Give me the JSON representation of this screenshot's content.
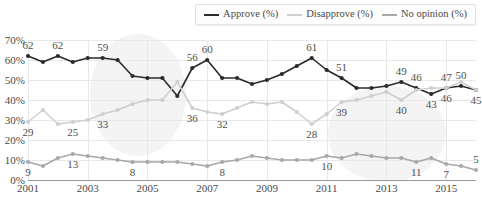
{
  "legend": {
    "items": [
      {
        "label": "Approve (%)",
        "color": "#2b2b2b"
      },
      {
        "label": "Disapprove (%)",
        "color": "#cfcfcf"
      },
      {
        "label": "No opinion (%)",
        "color": "#a8a8a8"
      }
    ]
  },
  "chart_data": {
    "type": "line",
    "title": "",
    "xlabel": "",
    "ylabel": "",
    "ylim": [
      0,
      70
    ],
    "ytick_labels": [
      "0%",
      "10%",
      "20%",
      "30%",
      "40%",
      "50%",
      "60%",
      "70%"
    ],
    "ytick_values": [
      0,
      10,
      20,
      30,
      40,
      50,
      60,
      70
    ],
    "xlim": [
      2001,
      2016
    ],
    "xtick_labels": [
      "2001",
      "2003",
      "2005",
      "2007",
      "2009",
      "2011",
      "2013",
      "2015"
    ],
    "xtick_values": [
      2001,
      2003,
      2005,
      2007,
      2009,
      2011,
      2013,
      2015
    ],
    "grid": true,
    "legend_position": "top-right",
    "x": [
      2001.0,
      2001.5,
      2002.0,
      2002.5,
      2003.0,
      2003.5,
      2004.0,
      2004.5,
      2005.0,
      2005.5,
      2006.0,
      2006.5,
      2007.0,
      2007.5,
      2008.0,
      2008.5,
      2009.0,
      2009.5,
      2010.0,
      2010.5,
      2011.0,
      2011.5,
      2012.0,
      2012.5,
      2013.0,
      2013.5,
      2014.0,
      2014.5,
      2015.0,
      2015.5,
      2016.0
    ],
    "series": [
      {
        "name": "Approve (%)",
        "color": "#2b2b2b",
        "values": [
          62,
          59,
          62,
          59,
          61,
          61,
          60,
          52,
          51,
          51,
          42,
          56,
          60,
          51,
          51,
          48,
          50,
          53,
          57,
          61,
          55,
          51,
          46,
          46,
          47,
          49,
          46,
          43,
          46,
          47,
          45
        ]
      },
      {
        "name": "Disapprove (%)",
        "color": "#cfcfcf",
        "values": [
          29,
          35,
          28,
          29,
          30,
          33,
          35,
          38,
          40,
          40,
          49,
          36,
          34,
          33,
          36,
          39,
          38,
          39,
          34,
          28,
          33,
          39,
          40,
          42,
          44,
          40,
          45,
          46,
          46,
          49,
          45
        ]
      },
      {
        "name": "No opinion (%)",
        "color": "#a8a8a8",
        "values": [
          9,
          7,
          11,
          13,
          12,
          11,
          10,
          9,
          9,
          9,
          9,
          8,
          7,
          9,
          10,
          12,
          11,
          10,
          10,
          10,
          12,
          11,
          13,
          12,
          11,
          11,
          9,
          11,
          8,
          7,
          5
        ]
      }
    ],
    "point_labels": [
      {
        "series": "Approve (%)",
        "x": 2001.0,
        "value": 62,
        "text": "62",
        "position": "above"
      },
      {
        "series": "Approve (%)",
        "x": 2002.0,
        "value": 62,
        "text": "62",
        "position": "above"
      },
      {
        "series": "Approve (%)",
        "x": 2003.5,
        "value": 61,
        "text": "59",
        "position": "above"
      },
      {
        "series": "Approve (%)",
        "x": 2006.5,
        "value": 56,
        "text": "56",
        "position": "above"
      },
      {
        "series": "Approve (%)",
        "x": 2007.0,
        "value": 60,
        "text": "60",
        "position": "above"
      },
      {
        "series": "Approve (%)",
        "x": 2010.5,
        "value": 61,
        "text": "61",
        "position": "above"
      },
      {
        "series": "Approve (%)",
        "x": 2011.5,
        "value": 51,
        "text": "51",
        "position": "above"
      },
      {
        "series": "Approve (%)",
        "x": 2013.5,
        "value": 49,
        "text": "49",
        "position": "above"
      },
      {
        "series": "Approve (%)",
        "x": 2014.0,
        "value": 46,
        "text": "46",
        "position": "above"
      },
      {
        "series": "Approve (%)",
        "x": 2015.0,
        "value": 46,
        "text": "47",
        "position": "above"
      },
      {
        "series": "Approve (%)",
        "x": 2015.5,
        "value": 47,
        "text": "50",
        "position": "above"
      },
      {
        "series": "Approve (%)",
        "x": 2014.5,
        "value": 43,
        "text": "43",
        "position": "below"
      },
      {
        "series": "Approve (%)",
        "x": 2015.0,
        "value": 46,
        "text": "46",
        "position": "below"
      },
      {
        "series": "Approve (%)",
        "x": 2016.0,
        "value": 45,
        "text": "45",
        "position": "below"
      },
      {
        "series": "Disapprove (%)",
        "x": 2001.0,
        "value": 29,
        "text": "29",
        "position": "below"
      },
      {
        "series": "Disapprove (%)",
        "x": 2002.5,
        "value": 29,
        "text": "25",
        "position": "below"
      },
      {
        "series": "Disapprove (%)",
        "x": 2003.5,
        "value": 33,
        "text": "33",
        "position": "below"
      },
      {
        "series": "Disapprove (%)",
        "x": 2006.5,
        "value": 36,
        "text": "36",
        "position": "below"
      },
      {
        "series": "Disapprove (%)",
        "x": 2007.5,
        "value": 33,
        "text": "32",
        "position": "below"
      },
      {
        "series": "Disapprove (%)",
        "x": 2010.5,
        "value": 28,
        "text": "28",
        "position": "below"
      },
      {
        "series": "Disapprove (%)",
        "x": 2011.5,
        "value": 39,
        "text": "39",
        "position": "below"
      },
      {
        "series": "Disapprove (%)",
        "x": 2013.5,
        "value": 40,
        "text": "40",
        "position": "below"
      },
      {
        "series": "No opinion (%)",
        "x": 2001.0,
        "value": 9,
        "text": "9",
        "position": "below"
      },
      {
        "series": "No opinion (%)",
        "x": 2002.5,
        "value": 13,
        "text": "13",
        "position": "below"
      },
      {
        "series": "No opinion (%)",
        "x": 2004.5,
        "value": 9,
        "text": "8",
        "position": "below"
      },
      {
        "series": "No opinion (%)",
        "x": 2007.5,
        "value": 9,
        "text": "8",
        "position": "below"
      },
      {
        "series": "No opinion (%)",
        "x": 2011.0,
        "value": 12,
        "text": "10",
        "position": "below"
      },
      {
        "series": "No opinion (%)",
        "x": 2014.0,
        "value": 9,
        "text": "11",
        "position": "below"
      },
      {
        "series": "No opinion (%)",
        "x": 2015.0,
        "value": 8,
        "text": "7",
        "position": "below"
      },
      {
        "series": "No opinion (%)",
        "x": 2016.0,
        "value": 5,
        "text": "5",
        "position": "above"
      }
    ]
  }
}
